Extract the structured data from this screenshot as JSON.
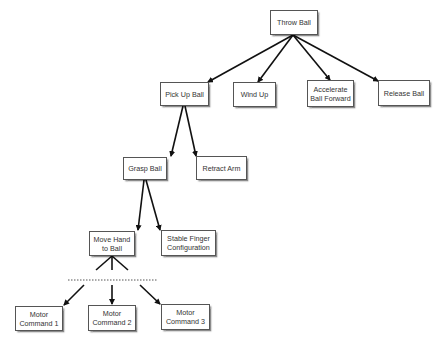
{
  "diagram": {
    "type": "hierarchical task tree",
    "nodes": [
      {
        "id": "throw_ball",
        "label": "Throw Ball",
        "x": 270,
        "y": 10,
        "w": 48,
        "h": 25
      },
      {
        "id": "pick_up_ball",
        "label": "Pick Up Ball",
        "x": 160,
        "y": 82,
        "w": 49,
        "h": 24
      },
      {
        "id": "wind_up",
        "label": "Wind Up",
        "x": 233,
        "y": 82,
        "w": 43,
        "h": 25
      },
      {
        "id": "accelerate_ball_forward",
        "label": "Accelerate\nBall Forward",
        "x": 307,
        "y": 80,
        "w": 47,
        "h": 27
      },
      {
        "id": "release_ball",
        "label": "Release Ball",
        "x": 378,
        "y": 80,
        "w": 52,
        "h": 26
      },
      {
        "id": "grasp_ball",
        "label": "Grasp Ball",
        "x": 123,
        "y": 157,
        "w": 44,
        "h": 23
      },
      {
        "id": "retract_arm",
        "label": "Retract Arm",
        "x": 196,
        "y": 156,
        "w": 51,
        "h": 24
      },
      {
        "id": "move_hand_to_ball",
        "label": "Move Hand\nto Ball",
        "x": 89,
        "y": 231,
        "w": 46,
        "h": 25
      },
      {
        "id": "stable_finger_configuration",
        "label": "Stable Finger\nConfiguration",
        "x": 161,
        "y": 230,
        "w": 55,
        "h": 26
      },
      {
        "id": "motor_command_1",
        "label": "Motor\nCommand 1",
        "x": 15,
        "y": 306,
        "w": 48,
        "h": 25
      },
      {
        "id": "motor_command_2",
        "label": "Motor\nCommand 2",
        "x": 88,
        "y": 305,
        "w": 48,
        "h": 26
      },
      {
        "id": "motor_command_3",
        "label": "Motor\nCommand 3",
        "x": 161,
        "y": 304,
        "w": 49,
        "h": 26
      }
    ],
    "edges": [
      {
        "from": "throw_ball",
        "to": "pick_up_ball",
        "x1": 293,
        "y1": 35,
        "x2": 208,
        "y2": 82
      },
      {
        "from": "throw_ball",
        "to": "wind_up",
        "x1": 293,
        "y1": 35,
        "x2": 258,
        "y2": 82
      },
      {
        "from": "throw_ball",
        "to": "accelerate_ball_forward",
        "x1": 293,
        "y1": 35,
        "x2": 330,
        "y2": 80
      },
      {
        "from": "throw_ball",
        "to": "release_ball",
        "x1": 293,
        "y1": 35,
        "x2": 378,
        "y2": 81
      },
      {
        "from": "pick_up_ball",
        "to": "grasp_ball",
        "x1": 183,
        "y1": 106,
        "x2": 171,
        "y2": 156
      },
      {
        "from": "pick_up_ball",
        "to": "retract_arm",
        "x1": 185,
        "y1": 106,
        "x2": 196,
        "y2": 156
      },
      {
        "from": "grasp_ball",
        "to": "move_hand_to_ball",
        "x1": 144,
        "y1": 180,
        "x2": 138,
        "y2": 230
      },
      {
        "from": "grasp_ball",
        "to": "stable_finger_configuration",
        "x1": 146,
        "y1": 180,
        "x2": 160,
        "y2": 230
      },
      {
        "from": "motor_group",
        "to": "motor_command_1",
        "x1": 84,
        "y1": 285,
        "x2": 64,
        "y2": 305
      },
      {
        "from": "motor_group",
        "to": "motor_command_2",
        "x1": 112,
        "y1": 285,
        "x2": 112,
        "y2": 304
      },
      {
        "from": "motor_group",
        "to": "motor_command_3",
        "x1": 140,
        "y1": 285,
        "x2": 160,
        "y2": 304
      }
    ],
    "fan_lines": [
      {
        "x1": 112,
        "y1": 256,
        "x2": 96,
        "y2": 270
      },
      {
        "x1": 112,
        "y1": 256,
        "x2": 112,
        "y2": 270
      },
      {
        "x1": 112,
        "y1": 256,
        "x2": 128,
        "y2": 270
      }
    ],
    "dotted_separator": {
      "x1": 68,
      "y1": 280,
      "x2": 158,
      "y2": 280
    }
  }
}
